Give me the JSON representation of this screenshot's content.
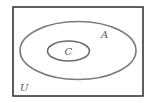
{
  "diagram": {
    "type": "venn",
    "universe": {
      "label": "U",
      "stroke": "#2a2a2a"
    },
    "sets": [
      {
        "label": "A",
        "stroke": "#7a7a7a",
        "contains": [
          "C"
        ]
      },
      {
        "label": "C",
        "stroke": "#6a6a6a"
      }
    ],
    "relationship": "C ⊆ A ⊆ U"
  }
}
